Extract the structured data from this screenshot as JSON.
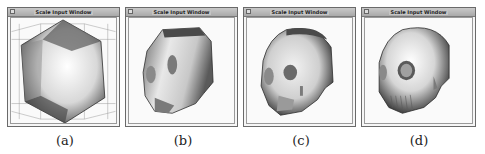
{
  "figure": {
    "panels": [
      {
        "id": "a",
        "window_title": "Scale Input Window",
        "caption": "(a)",
        "content": "icosahedral-initial-surface-with-bounding-grid"
      },
      {
        "id": "b",
        "window_title": "Scale Input Window",
        "caption": "(b)",
        "content": "coarse-skull-reconstruction"
      },
      {
        "id": "c",
        "window_title": "Scale Input Window",
        "caption": "(c)",
        "content": "intermediate-skull-reconstruction"
      },
      {
        "id": "d",
        "window_title": "Scale Input Window",
        "caption": "(d)",
        "content": "detailed-skull-reconstruction"
      }
    ]
  }
}
